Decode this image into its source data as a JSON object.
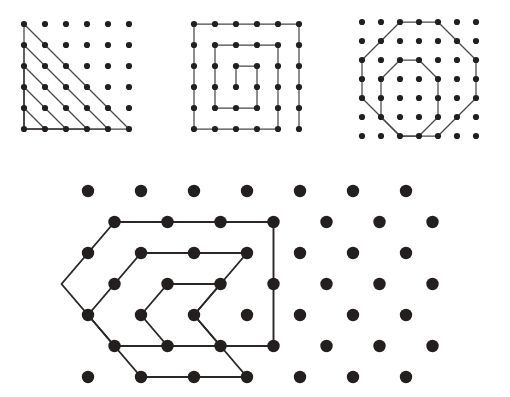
{
  "figure": {
    "background_color": "#ffffff",
    "dot_color": "#231f1e",
    "line_color": "#4a4746",
    "panel_count": 4
  },
  "panels": [
    {
      "id": "panel-triangles",
      "name": "nested-right-triangles",
      "label": "Nested right triangles on square lattice",
      "lattice": {
        "type": "square",
        "cols": 6,
        "rows": 6,
        "spacing": 21,
        "origin_x": 24,
        "origin_y": 24,
        "dot_radius": 3.1
      },
      "shapes": [
        {
          "name": "triangle-5",
          "size": 5,
          "points": "0,0 0,5 5,5"
        },
        {
          "name": "triangle-4",
          "size": 4,
          "points": "0,1 0,5 4,5"
        },
        {
          "name": "triangle-3",
          "size": 3,
          "points": "0,2 0,5 3,5"
        },
        {
          "name": "triangle-2",
          "size": 2,
          "points": "0,3 0,5 2,5"
        },
        {
          "name": "triangle-1",
          "size": 1,
          "points": "0,4 0,5 1,5"
        }
      ]
    },
    {
      "id": "panel-spiral",
      "name": "rectangular-spiral",
      "label": "Rectangular spiral on square lattice",
      "lattice": {
        "type": "square",
        "cols": 6,
        "rows": 6,
        "spacing": 21,
        "origin_x": 24,
        "origin_y": 24,
        "dot_radius": 3.1
      },
      "shapes": [
        {
          "name": "spiral-path",
          "points": "5,5 5,0 0,0 0,5 4,5 4,1 1,1 1,4 3,4 3,2 2,2 2,3"
        }
      ]
    },
    {
      "id": "panel-octagons",
      "name": "nested-octagons",
      "label": "Two nested octagons on square lattice",
      "lattice": {
        "type": "square",
        "cols": 7,
        "rows": 7,
        "spacing": 19,
        "origin_x": 22,
        "origin_y": 22,
        "dot_radius": 3.1
      },
      "shapes": [
        {
          "name": "outer-octagon",
          "points": "2,0 4,0 6,2 6,4 4,6 2,6 0,4 0,2"
        },
        {
          "name": "inner-octagon",
          "points": "2,2 3,2 4,3 4,5 3,6 2,6 1,5 1,3"
        }
      ]
    },
    {
      "id": "panel-hexagons",
      "name": "nested-hexagons",
      "label": "Three nested hexagons on triangular lattice",
      "lattice": {
        "type": "triangular",
        "rows": 7,
        "cols": 7,
        "spacing_x": 53,
        "spacing_y": 31,
        "row_offset": 26.5,
        "origin_x": 28,
        "origin_y": 19,
        "dot_radius": 6.2,
        "offset_rows": [
          1,
          3,
          5
        ]
      },
      "shapes": [
        {
          "name": "hexagon-large",
          "points": "r1c0 r1c3 r3c3 r5c3 r5c0 r3c-1"
        },
        {
          "name": "hexagon-medium",
          "points": "r2c1 r2c3 r4c2 r6c3 r6c1 r4c0"
        },
        {
          "name": "hexagon-small",
          "points": "r3c1 r3c2 r4c2 r5c2 r5c1 r4c1"
        }
      ]
    }
  ]
}
